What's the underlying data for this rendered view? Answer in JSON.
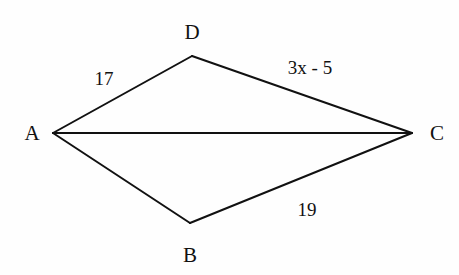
{
  "diagram": {
    "type": "kite / quadrilateral with diagonal",
    "line_color": "#111111",
    "background": "#fefefe",
    "vertices": [
      {
        "id": "A",
        "label": "A",
        "x": 53,
        "y": 133,
        "label_x": 32,
        "label_y": 140
      },
      {
        "id": "D",
        "label": "D",
        "x": 192,
        "y": 56,
        "label_x": 192,
        "label_y": 39
      },
      {
        "id": "C",
        "label": "C",
        "x": 412,
        "y": 133,
        "label_x": 437,
        "label_y": 140
      },
      {
        "id": "B",
        "label": "B",
        "x": 190,
        "y": 223,
        "label_x": 190,
        "label_y": 262
      }
    ],
    "segments": [
      {
        "from": "A",
        "to": "D",
        "label": "17",
        "label_x": 104,
        "label_y": 85
      },
      {
        "from": "D",
        "to": "C",
        "label": "3x - 5",
        "label_x": 310,
        "label_y": 74
      },
      {
        "from": "C",
        "to": "B",
        "label": "19",
        "label_x": 307,
        "label_y": 216
      },
      {
        "from": "B",
        "to": "A",
        "label": ""
      },
      {
        "from": "A",
        "to": "C",
        "label": ""
      }
    ]
  }
}
